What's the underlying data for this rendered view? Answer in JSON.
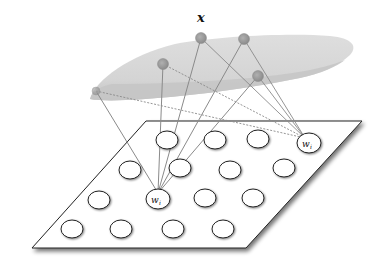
{
  "diagram": {
    "type": "self-organizing-map",
    "input_label": "x",
    "input_manifold": {
      "fill_top": "#d9d9d9",
      "fill_bottom": "#c4c4c4",
      "nodes": [
        {
          "id": "n1",
          "cx": 201,
          "cy": 38
        },
        {
          "id": "n2",
          "cx": 244,
          "cy": 39
        },
        {
          "id": "n3",
          "cx": 163,
          "cy": 64
        },
        {
          "id": "n4",
          "cx": 258,
          "cy": 76
        },
        {
          "id": "n5",
          "cx": 96,
          "cy": 91
        }
      ],
      "node_color": "#9e9e9e"
    },
    "map_plane": {
      "corners": [
        [
          146,
          121
        ],
        [
          362,
          121
        ],
        [
          246,
          248
        ],
        [
          32,
          248
        ]
      ],
      "fill": "#ffffff",
      "stroke": "#222222"
    },
    "map_units": [
      {
        "cx": 167,
        "cy": 140
      },
      {
        "cy": 140,
        "cx": 215
      },
      {
        "cx": 258,
        "cy": 139
      },
      {
        "cx": 130,
        "cy": 170
      },
      {
        "cx": 180,
        "cy": 168
      },
      {
        "cx": 230,
        "cy": 170
      },
      {
        "cx": 284,
        "cy": 168
      },
      {
        "cx": 99,
        "cy": 200
      },
      {
        "cx": 205,
        "cy": 198
      },
      {
        "cx": 253,
        "cy": 198
      },
      {
        "cx": 72,
        "cy": 229
      },
      {
        "cx": 121,
        "cy": 229
      },
      {
        "cx": 173,
        "cy": 229
      },
      {
        "cx": 223,
        "cy": 229
      }
    ],
    "labeled_units": [
      {
        "id": "winner",
        "cx": 158,
        "cy": 198,
        "label": "w",
        "subscript": "i"
      },
      {
        "id": "far",
        "cx": 309,
        "cy": 143,
        "label": "w",
        "subscript": "i"
      }
    ],
    "solid_connections_to": "winner",
    "dashed_connections_to": "far",
    "line_color": "#8a8a8a"
  }
}
